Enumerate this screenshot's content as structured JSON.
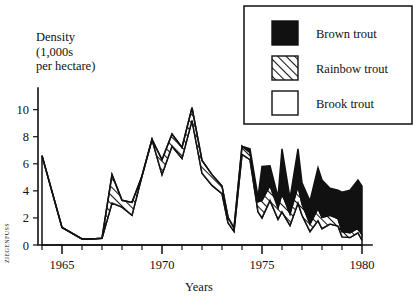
{
  "chart_data": {
    "type": "area",
    "stacked": true,
    "title": "",
    "xlabel": "Years",
    "ylabel": "Density (1,000s per hectare)",
    "ylabel_lines": [
      "Density",
      "(1,000s",
      "per hectare)"
    ],
    "xlim": [
      1963.6,
      1980.3
    ],
    "ylim": [
      0,
      11.6
    ],
    "yticks": [
      0,
      2,
      4,
      6,
      8,
      10
    ],
    "ytick_labels": [
      "0",
      "2",
      "4",
      "6",
      "8",
      "10"
    ],
    "xticks": [
      1964,
      1965,
      1966,
      1967,
      1968,
      1969,
      1970,
      1971,
      1972,
      1973,
      1974,
      1975,
      1976,
      1977,
      1978,
      1979,
      1980
    ],
    "xtick_labels_shown": [
      "1965",
      "1970",
      "1975",
      "1980"
    ],
    "xtick_label_years": [
      1965,
      1970,
      1975,
      1980
    ],
    "grid": false,
    "legend_position": "top-right",
    "x": [
      1964,
      1965,
      1966,
      1966.5,
      1967,
      1967.5,
      1968,
      1968.5,
      1969,
      1969.5,
      1970,
      1970.5,
      1971,
      1971.5,
      1972,
      1972.5,
      1973,
      1973.3,
      1973.6,
      1974,
      1974.4,
      1974.8,
      1975,
      1975.4,
      1975.8,
      1976,
      1976.4,
      1976.8,
      1977,
      1977.4,
      1977.8,
      1978,
      1978.4,
      1978.8,
      1979,
      1979.4,
      1979.8,
      1980
    ],
    "series": [
      {
        "name": "Brook trout",
        "fill": "#ffffff",
        "pattern": "solid-white",
        "values": [
          6.6,
          1.3,
          0.45,
          0.45,
          0.5,
          3.1,
          2.8,
          2.2,
          5.1,
          7.8,
          5.2,
          7.3,
          6.4,
          9.2,
          5.3,
          4.4,
          3.8,
          1.65,
          1.0,
          6.7,
          6.3,
          2.45,
          2.0,
          3.3,
          1.9,
          2.45,
          1.45,
          3.1,
          2.2,
          1.0,
          1.8,
          1.2,
          1.55,
          1.4,
          0.6,
          0.55,
          0.9,
          0.35
        ]
      },
      {
        "name": "Rainbow trout",
        "fill": "#ffffff",
        "pattern": "diagonal-hatch",
        "values": [
          0,
          0,
          0,
          0,
          0,
          2.1,
          0.5,
          0.95,
          0,
          0,
          1.1,
          0.9,
          0.8,
          0.95,
          0.95,
          0.8,
          0.55,
          0.4,
          0.25,
          0.6,
          0.55,
          0.75,
          1.3,
          1.1,
          0.85,
          1.35,
          0.85,
          1.25,
          0.85,
          0.55,
          0.9,
          0.85,
          0.65,
          0.55,
          0.4,
          0.35,
          0.35,
          0.4
        ]
      },
      {
        "name": "Brown trout",
        "fill": "#111111",
        "pattern": "solid-black",
        "values": [
          0,
          0,
          0,
          0,
          0,
          0,
          0,
          0,
          0,
          0,
          0,
          0,
          0,
          0,
          0,
          0,
          0,
          0,
          0,
          0,
          0.25,
          0.35,
          2.5,
          1.45,
          0.8,
          3.3,
          1.15,
          2.75,
          1.55,
          1.7,
          3.0,
          2.75,
          2.0,
          2.1,
          2.9,
          3.15,
          3.55,
          3.6
        ]
      }
    ],
    "legend_entries": [
      {
        "label": "Brown trout",
        "pattern": "solid-black"
      },
      {
        "label": "Rainbow trout",
        "pattern": "diagonal-hatch"
      },
      {
        "label": "Brook trout",
        "pattern": "solid-white"
      }
    ]
  },
  "credit": "ZIEGENFUSS"
}
